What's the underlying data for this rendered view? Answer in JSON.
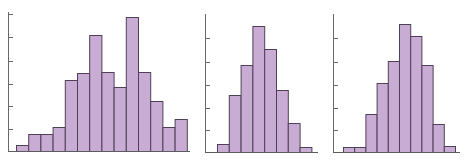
{
  "chart_data": [
    {
      "type": "bar",
      "subtype": "histogram",
      "title": "",
      "xlabel": "",
      "ylabel": "",
      "categories": [
        "1",
        "2",
        "3",
        "4",
        "5",
        "6",
        "7",
        "8",
        "9",
        "10",
        "11",
        "12",
        "13",
        "14"
      ],
      "values": [
        6,
        17,
        17,
        24,
        71,
        78,
        116,
        79,
        64,
        134,
        79,
        50,
        24,
        32
      ],
      "value_units": "relative height (px, baseline=0)",
      "y_ticks_px": [
        22,
        45,
        67,
        90,
        114,
        137
      ],
      "ylim": [
        0,
        140
      ],
      "grid": false,
      "legend": null,
      "bar_fill": "#c8acd3",
      "bar_edge": "#4f4057"
    },
    {
      "type": "bar",
      "subtype": "histogram",
      "title": "",
      "xlabel": "",
      "ylabel": "",
      "categories": [
        "1",
        "2",
        "3",
        "4",
        "5",
        "6",
        "7",
        "8"
      ],
      "values": [
        8,
        57,
        87,
        126,
        103,
        62,
        29,
        5
      ],
      "value_units": "relative height (px, baseline=0)",
      "y_ticks_px": [
        22,
        44,
        67,
        90,
        114
      ],
      "ylim": [
        0,
        140
      ],
      "grid": false,
      "legend": null,
      "bar_fill": "#c8acd3",
      "bar_edge": "#4f4057"
    },
    {
      "type": "bar",
      "subtype": "histogram",
      "title": "",
      "xlabel": "",
      "ylabel": "",
      "categories": [
        "1",
        "2",
        "3",
        "4",
        "5",
        "6",
        "7",
        "8",
        "9",
        "10"
      ],
      "values": [
        5,
        5,
        38,
        69,
        91,
        128,
        116,
        87,
        28,
        6
      ],
      "value_units": "relative height (px, baseline=0)",
      "y_ticks_px": [
        22,
        44,
        67,
        90,
        114
      ],
      "ylim": [
        0,
        140
      ],
      "grid": false,
      "legend": null,
      "bar_fill": "#c8acd3",
      "bar_edge": "#4f4057"
    }
  ],
  "panels": [
    {
      "name": "histogram-1",
      "left": 0,
      "width": 196,
      "axis_x": 8,
      "axis_top": 12,
      "base_y": 151,
      "bars_x0": 16,
      "bar_w": 12.2,
      "baseline_x1": 190
    },
    {
      "name": "histogram-2",
      "left": 196,
      "width": 128,
      "axis_x": 9,
      "axis_top": 14,
      "base_y": 152,
      "bars_x0": 21,
      "bar_w": 11.8,
      "baseline_x1": 122
    },
    {
      "name": "histogram-3",
      "left": 324,
      "width": 148,
      "axis_x": 9,
      "axis_top": 14,
      "base_y": 152,
      "bars_x0": 19,
      "bar_w": 11.2,
      "baseline_x1": 136
    }
  ]
}
